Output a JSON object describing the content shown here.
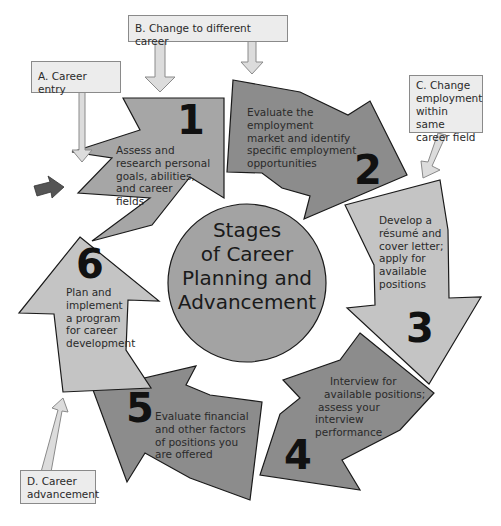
{
  "diagram": {
    "title": "Stages of Career Planning and Advancement",
    "title_lines": [
      "Stages",
      "of Career",
      "Planning and",
      "Advancement"
    ],
    "colors": {
      "stage_dark": "#8c8c8c",
      "stage_mid": "#a6a6a6",
      "stage_light": "#c4c4c4",
      "center_circle": "#a3a3a3",
      "entry_box_fill": "#ececec",
      "entry_arrow_fill": "#dcdcdc",
      "pointer_arrow": "#555555"
    },
    "stages": [
      {
        "number": "1",
        "lines": [
          "Assess and",
          "research personal",
          "goals, abilities,",
          "and career",
          "fields"
        ]
      },
      {
        "number": "2",
        "lines": [
          "Evaluate the",
          "employment",
          "market and identify",
          "specific employment",
          "opportunities"
        ]
      },
      {
        "number": "3",
        "lines": [
          "Develop a",
          "résumé and",
          "cover letter;",
          "apply for",
          "available",
          "positions"
        ]
      },
      {
        "number": "4",
        "lines": [
          "Interview for",
          "available positions;",
          "assess your",
          "interview",
          "performance"
        ]
      },
      {
        "number": "5",
        "lines": [
          "Evaluate financial",
          "and other factors",
          "of positions you",
          "are offered"
        ]
      },
      {
        "number": "6",
        "lines": [
          "Plan and",
          "implement",
          "a program",
          "for career",
          "development"
        ]
      }
    ],
    "entry_points": [
      {
        "id": "A",
        "lines": [
          "A. Career entry"
        ]
      },
      {
        "id": "B",
        "lines": [
          "B. Change to different career"
        ]
      },
      {
        "id": "C",
        "lines": [
          "C. Change",
          "employment",
          "within same",
          "career field"
        ]
      },
      {
        "id": "D",
        "lines": [
          "D. Career",
          "advancement"
        ]
      }
    ]
  }
}
